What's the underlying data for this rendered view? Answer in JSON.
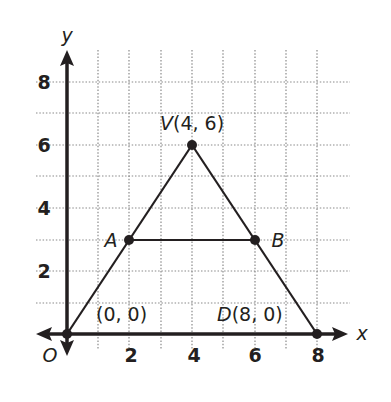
{
  "diagram": {
    "type": "coordinate-geometry",
    "axes": {
      "x_label": "x",
      "y_label": "y",
      "origin_label": "O",
      "x_ticks": [
        "2",
        "4",
        "6",
        "8"
      ],
      "y_ticks": [
        "2",
        "4",
        "6",
        "8"
      ],
      "x_range": [
        -1,
        9
      ],
      "y_range": [
        -1,
        9
      ],
      "grid": "dotted, 1 unit"
    },
    "points": {
      "V": {
        "name": "V",
        "coords": "(4, 6)",
        "x": 4,
        "y": 6
      },
      "A": {
        "name": "A",
        "x": 2,
        "y": 3
      },
      "B": {
        "name": "B",
        "x": 6,
        "y": 3
      },
      "O": {
        "name": "O",
        "coords": "(0, 0)",
        "x": 0,
        "y": 0
      },
      "D": {
        "name": "D",
        "coords": "(8, 0)",
        "x": 8,
        "y": 0
      }
    },
    "labels": {
      "V_name": "V",
      "V_coords": "(4, 6)",
      "A": "A",
      "B": "B",
      "O_coords": "(0, 0)",
      "D_name": "D",
      "D_coords": "(8, 0)"
    },
    "segments": [
      "OV",
      "VD",
      "AB"
    ],
    "colors": {
      "ink": "#231f20",
      "grid": "#8a8a8a",
      "background": "#ffffff"
    }
  }
}
